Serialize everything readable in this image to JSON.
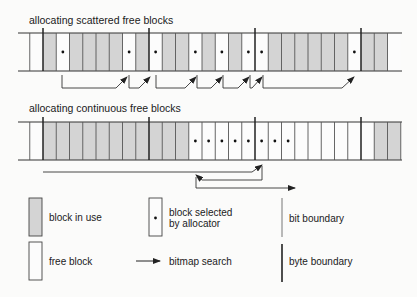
{
  "diagram": {
    "sections": [
      {
        "title": "allocating scattered free blocks",
        "cells": [
          "free",
          "use",
          "sel",
          "use",
          "use",
          "use",
          "use",
          "sel",
          "use",
          "sel",
          "use",
          "use",
          "sel",
          "use",
          "sel",
          "use",
          "sel",
          "sel",
          "use",
          "use",
          "use",
          "use",
          "use",
          "use",
          "sel",
          "use",
          "use",
          "free"
        ]
      },
      {
        "title": "allocating continuous free blocks",
        "cells": [
          "free",
          "use",
          "use",
          "use",
          "use",
          "use",
          "use",
          "use",
          "use",
          "use",
          "use",
          "use",
          "sel",
          "sel",
          "sel",
          "sel",
          "sel",
          "sel",
          "sel",
          "sel",
          "free",
          "free",
          "free",
          "free",
          "free",
          "free",
          "use",
          "use"
        ]
      }
    ],
    "legend": {
      "block_in_use": "block in use",
      "block_selected_line1": "block selected",
      "block_selected_line2": "by allocator",
      "bit_boundary": "bit boundary",
      "free_block": "free block",
      "bitmap_search": "bitmap search",
      "byte_boundary": "byte boundary"
    },
    "colors": {
      "block_in_use": "#d4d4d4",
      "free_block": "#fcfcfc",
      "line": "#333333",
      "bit_line": "#555555"
    }
  }
}
